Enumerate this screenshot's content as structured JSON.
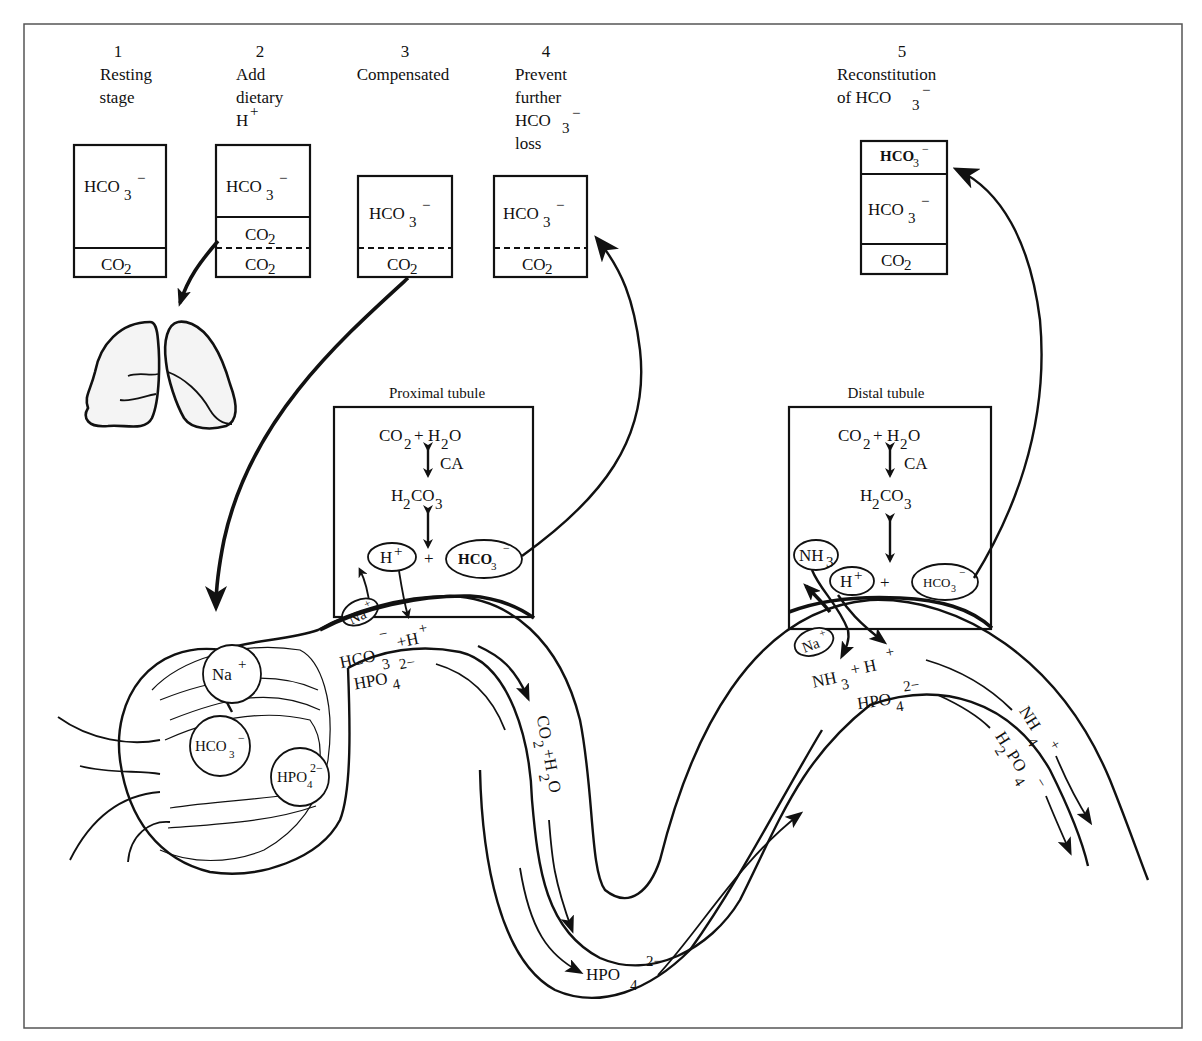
{
  "figure": {
    "frame_color": "#555555",
    "ink_color": "#111111"
  },
  "stages": [
    {
      "number": "1",
      "title_lines": [
        "Resting",
        "stage"
      ],
      "box": {
        "segments": [
          {
            "label": "HCO3",
            "sub": "3",
            "sup": "−"
          },
          {
            "label": "CO2",
            "sub": "2",
            "sup": ""
          }
        ],
        "divider": "solid"
      }
    },
    {
      "number": "2",
      "title_lines": [
        "Add",
        "dietary",
        "H+"
      ],
      "box": {
        "segments": [
          {
            "label": "HCO3",
            "sub": "3",
            "sup": "−"
          },
          {
            "label": "CO2",
            "sub": "2",
            "sup": ""
          },
          {
            "label": "CO2",
            "sub": "2",
            "sup": ""
          }
        ],
        "divider": "dashed"
      }
    },
    {
      "number": "3",
      "title_lines": [
        "Compensated"
      ],
      "box": {
        "segments": [
          {
            "label": "HCO3",
            "sub": "3",
            "sup": "−"
          },
          {
            "label": "CO2",
            "sub": "2",
            "sup": ""
          }
        ],
        "divider": "dashed"
      }
    },
    {
      "number": "4",
      "title_lines": [
        "Prevent",
        "further",
        "HCO3−",
        "loss"
      ],
      "box": {
        "segments": [
          {
            "label": "HCO3",
            "sub": "3",
            "sup": "−"
          },
          {
            "label": "CO2",
            "sub": "2",
            "sup": ""
          }
        ],
        "divider": "dashed"
      }
    },
    {
      "number": "5",
      "title_lines": [
        "Reconstitution",
        "of HCO3−"
      ],
      "box": {
        "segments": [
          {
            "label": "HCO3",
            "sub": "3",
            "sup": "−"
          },
          {
            "label": "HCO3",
            "sub": "3",
            "sup": "−"
          },
          {
            "label": "CO2",
            "sub": "2",
            "sup": ""
          }
        ],
        "divider": "solid"
      }
    }
  ],
  "text": {
    "s1_num": "1",
    "s1_l1": "Resting",
    "s1_l2": "stage",
    "s2_num": "2",
    "s2_l1": "Add",
    "s2_l2": "dietary",
    "s2_l3": "H",
    "s3_num": "3",
    "s3_l1": "Compensated",
    "s4_num": "4",
    "s4_l1": "Prevent",
    "s4_l2": "further",
    "s4_l3": "HCO",
    "s4_l4": "loss",
    "s5_num": "5",
    "s5_l1": "Reconstitution",
    "s5_l2": "of HCO",
    "hco": "HCO",
    "co": "CO",
    "sub2": "2",
    "sub3": "3",
    "sub4": "4",
    "minus": "−",
    "plus": "+",
    "proximal_title": "Proximal tubule",
    "distal_title": "Distal tubule",
    "h2o": "H",
    "o": "O",
    "ca": "CA",
    "h2co3_h": "H",
    "h2co3_co": "CO",
    "h_ion": "H",
    "na": "Na",
    "nh": "NH",
    "hpo": "HPO",
    "two_minus": "2−",
    "filtrate_hco3": "HCO",
    "plus_h": "+H",
    "co2_h2o_co": "CO",
    "co2_h2o_plus": "+H",
    "co2_h2o_o": "O",
    "nh4": "NH",
    "h2po4_h": "H",
    "h2po4_po": "PO",
    "nh3_plus_h": "+  H"
  },
  "cells": {
    "proximal": {
      "title": "Proximal tubule",
      "reactions": [
        "CO2 + H2O",
        "CA",
        "H2CO3",
        "H+ + HCO3−"
      ],
      "transporters": [
        "Na+",
        "H+",
        "HCO3−"
      ]
    },
    "distal": {
      "title": "Distal tubule",
      "reactions": [
        "CO2 + H2O",
        "CA",
        "H2CO3",
        "H+ + HCO3−"
      ],
      "transporters": [
        "NH3",
        "Na+",
        "H+",
        "HCO3−"
      ]
    }
  },
  "glomerulus": {
    "ions": [
      "Na+",
      "HCO3−",
      "HPO4 2−"
    ]
  },
  "lumen_labels": {
    "proximal": [
      "HCO3− + H+",
      "HPO4 2−",
      "CO2 + H2O"
    ],
    "loop": [
      "HPO4 2−"
    ],
    "distal": [
      "NH3 + H+",
      "HPO4 2−",
      "NH4+",
      "H2PO4−"
    ]
  }
}
